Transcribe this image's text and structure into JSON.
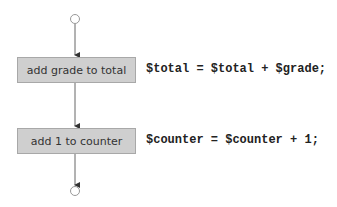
{
  "diagram": {
    "type": "activity-diagram",
    "initial_state": {
      "shape": "hollow-circle"
    },
    "final_state": {
      "shape": "hollow-circle"
    },
    "actions": [
      {
        "label": "add grade to total",
        "code": "$total = $total + $grade;"
      },
      {
        "label": "add 1 to counter",
        "code": "$counter = $counter + 1;"
      }
    ],
    "colors": {
      "box_fill": "#cfcfcf",
      "box_border": "#a8a8a8",
      "line": "#666666",
      "text": "#333333"
    }
  }
}
